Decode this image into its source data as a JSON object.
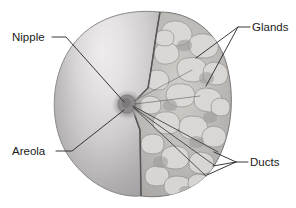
{
  "figure": {
    "background_color": "#ffffff",
    "width": 296,
    "height": 208
  },
  "labels": [
    {
      "id": "nipple",
      "text": "Nipple",
      "x": 12,
      "y": 41,
      "side": "left"
    },
    {
      "id": "areola",
      "text": "Areola",
      "x": 12,
      "y": 155,
      "side": "left"
    },
    {
      "id": "glands",
      "text": "Glands",
      "x": 252,
      "y": 31,
      "side": "right"
    },
    {
      "id": "ducts",
      "text": "Ducts",
      "x": 250,
      "y": 166,
      "side": "right"
    }
  ],
  "colors": {
    "background": "#ffffff",
    "skin_highlight": "#eceaea",
    "skin_light": "#dcdada",
    "skin_mid": "#b9b7b7",
    "skin_shadow": "#a2a0a0",
    "gland_base": "#b4b3b2",
    "gland_light": "#d8d7d5",
    "gland_dark": "#8f8e8d",
    "nipple": "#8a8888",
    "areola_tone": "#9b9999",
    "outline": "#565656",
    "leader_line": "#252525",
    "text": "#1a1a1a"
  },
  "structures": {
    "breast_dome": "smooth rounded breast surface, left three-quarters, light grey with highlight upper-left",
    "cutaway_face": "vertical wedge cut revealing interior, right portion",
    "nipple_point": {
      "x": 131,
      "y": 105
    },
    "gland_region": "mottled lobular glandular tissue filling the cut face",
    "duct_count": 3
  }
}
